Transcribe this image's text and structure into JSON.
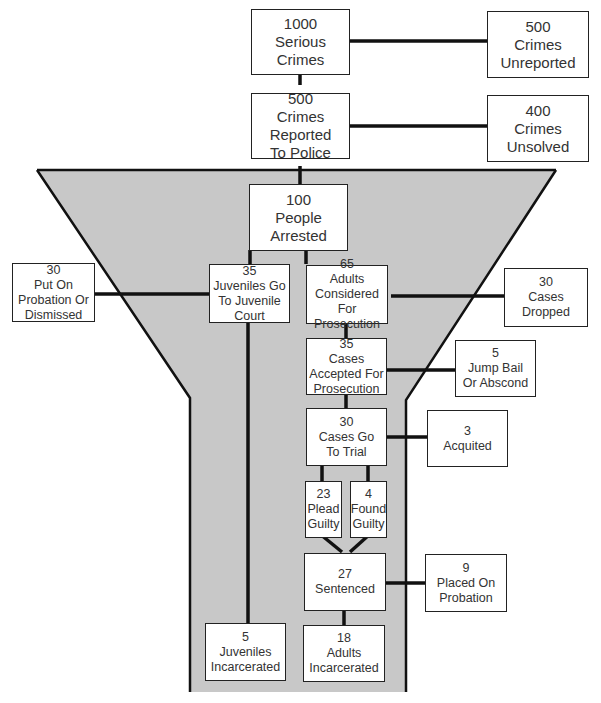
{
  "diagram": {
    "type": "funnel-flowchart",
    "fill_color": "#c8c8c8",
    "line_color": "#111111",
    "nodes": {
      "serious": {
        "count": "1000",
        "label1": "Serious",
        "label2": "Crimes"
      },
      "unreported": {
        "count": "500",
        "label1": "Crimes",
        "label2": "Unreported"
      },
      "reported": {
        "count": "500",
        "label1": "Crimes Reported",
        "label2": "To Police"
      },
      "unsolved": {
        "count": "400",
        "label1": "Crimes",
        "label2": "Unsolved"
      },
      "arrested": {
        "count": "100",
        "label1": "People",
        "label2": "Arrested"
      },
      "probation_dismissed": {
        "count": "30",
        "label1": "Put On",
        "label2": "Probation Or",
        "label3": "Dismissed"
      },
      "juvenile_court": {
        "count": "35",
        "label1": "Juveniles Go",
        "label2": "To Juvenile",
        "label3": "Court"
      },
      "adults_considered": {
        "count": "65",
        "label1": "Adults",
        "label2": "Considered For",
        "label3": "Prosecution"
      },
      "cases_dropped": {
        "count": "30",
        "label1": "Cases",
        "label2": "Dropped"
      },
      "cases_accepted": {
        "count": "35",
        "label1": "Cases",
        "label2": "Accepted For",
        "label3": "Prosecution"
      },
      "jump_bail": {
        "count": "5",
        "label1": "Jump Bail",
        "label2": "Or Abscond"
      },
      "trial": {
        "count": "30",
        "label1": "Cases Go",
        "label2": "To Trial"
      },
      "acquitted": {
        "count": "3",
        "label1": "Acquited"
      },
      "plead_guilty": {
        "count": "23",
        "label1": "Plead",
        "label2": "Guilty"
      },
      "found_guilty": {
        "count": "4",
        "label1": "Found",
        "label2": "Guilty"
      },
      "sentenced": {
        "count": "27",
        "label1": "Sentenced"
      },
      "placed_probation": {
        "count": "9",
        "label1": "Placed On",
        "label2": "Probation"
      },
      "juveniles_incarcerated": {
        "count": "5",
        "label1": "Juveniles",
        "label2": "Incarcerated"
      },
      "adults_incarcerated": {
        "count": "18",
        "label1": "Adults",
        "label2": "Incarcerated"
      }
    }
  }
}
